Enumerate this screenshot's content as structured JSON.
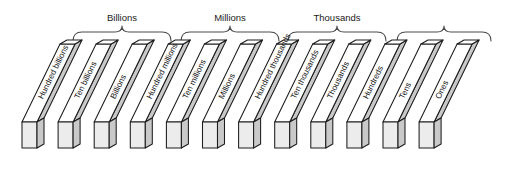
{
  "figure": {
    "orientation": "isometric-slanted-bars",
    "bar_count": 12,
    "group_count": 4
  },
  "groups": [
    {
      "label": "Billions",
      "brace_x1": 72,
      "brace_x2": 172,
      "label_x": 122,
      "label_y": 24,
      "apex_x": 122
    },
    {
      "label": "Millions",
      "brace_x1": 180,
      "brace_x2": 280,
      "label_x": 230,
      "label_y": 24,
      "apex_x": 230
    },
    {
      "label": "Thousands",
      "brace_x1": 287,
      "brace_x2": 387,
      "label_x": 337,
      "label_y": 24,
      "apex_x": 337
    },
    {
      "label": "",
      "brace_x1": 396,
      "brace_x2": 492,
      "label_x": 444,
      "label_y": 24,
      "apex_x": 444
    }
  ],
  "bars": [
    {
      "label": "Hundred billions",
      "index": 0,
      "group": "Billions"
    },
    {
      "label": "Ten billions",
      "index": 1,
      "group": "Billions"
    },
    {
      "label": "Billions",
      "index": 2,
      "group": "Billions"
    },
    {
      "label": "Hundred millions",
      "index": 3,
      "group": "Millions"
    },
    {
      "label": "Ten millions",
      "index": 4,
      "group": "Millions"
    },
    {
      "label": "Millions",
      "index": 5,
      "group": "Millions"
    },
    {
      "label": "Hundred thousands",
      "index": 6,
      "group": "Thousands"
    },
    {
      "label": "Ten thousands",
      "index": 7,
      "group": "Thousands"
    },
    {
      "label": "Thousands",
      "index": 8,
      "group": "Thousands"
    },
    {
      "label": "Hundreds",
      "index": 9,
      "group": "Ones"
    },
    {
      "label": "Tens",
      "index": 10,
      "group": "Ones"
    },
    {
      "label": "Ones",
      "index": 11,
      "group": "Ones"
    }
  ],
  "colors": {
    "background": "#ffffff",
    "top_face": "#ffffff",
    "side_face": "#c9c9c9",
    "front_face": "#ececec",
    "outline": "#1c1c1c",
    "brace_stroke": "#4a4a4a",
    "label_text": "#141414"
  },
  "geometry": {
    "bar_pitch": 36.1,
    "bar_first_x": 22,
    "bar_top_width": 15,
    "bar_side_width": 7,
    "base_y": 148,
    "top_y": 44,
    "slant_dx": 38,
    "label_angle": -47
  }
}
